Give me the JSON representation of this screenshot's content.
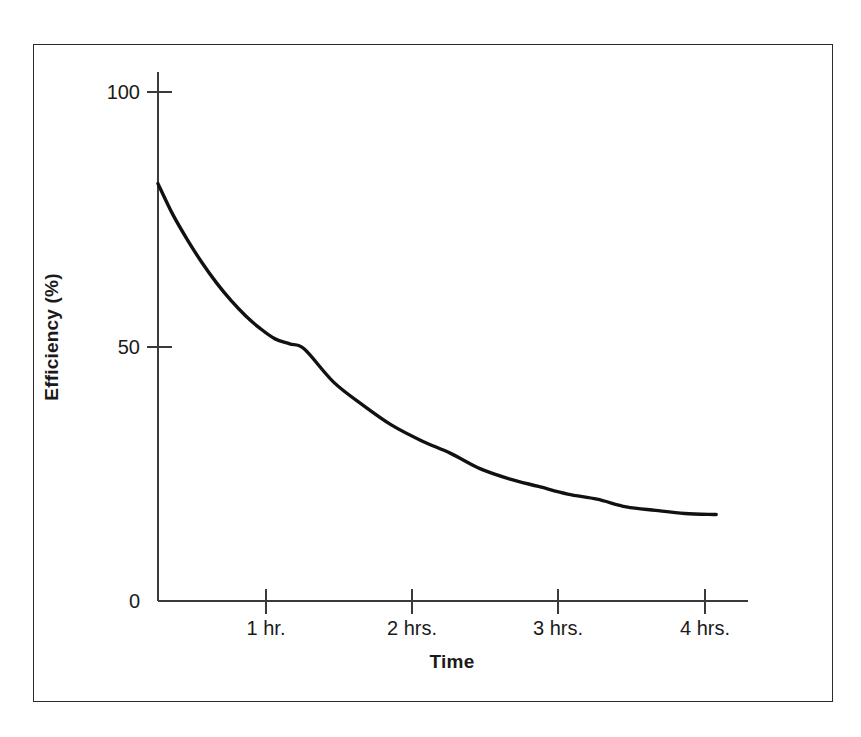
{
  "figure": {
    "frame_color": "#2b2b2b",
    "background_color": "#ffffff",
    "curve_color": "#111111",
    "axis_color": "#3a3a3a"
  },
  "axes": {
    "y_title": "Efficiency (%)",
    "x_title": "Time",
    "y_tick_labels": [
      "100",
      "50",
      "0"
    ],
    "x_tick_labels": [
      "1 hr.",
      "2 hrs.",
      "3 hrs.",
      "4 hrs."
    ]
  },
  "chart_data": {
    "type": "line",
    "title": "",
    "subtitle": "",
    "xlabel": "Time",
    "ylabel": "Efficiency (%)",
    "xlim": [
      0,
      4.05
    ],
    "ylim": [
      0,
      100
    ],
    "x_ticks": [
      1,
      2,
      3,
      4
    ],
    "x_tick_labels": [
      "1 hr.",
      "2 hrs.",
      "3 hrs.",
      "4 hrs."
    ],
    "y_ticks": [
      0,
      50,
      100
    ],
    "y_tick_labels": [
      "0",
      "50",
      "100"
    ],
    "grid": false,
    "legend": null,
    "legend_position": "none",
    "annotations": [],
    "series": [
      {
        "name": "Efficiency decay",
        "x": [
          0.0,
          0.1,
          0.2,
          0.3,
          0.4,
          0.5,
          0.6,
          0.7,
          0.8,
          0.9,
          1.0,
          1.2,
          1.4,
          1.6,
          1.8,
          2.0,
          2.2,
          2.4,
          2.6,
          2.8,
          3.0,
          3.2,
          3.4,
          3.6,
          3.8,
          3.8
        ],
        "y": [
          82.0,
          76.0,
          71.0,
          66.5,
          62.5,
          59.0,
          56.0,
          53.5,
          51.5,
          50.5,
          49.5,
          43.0,
          38.5,
          34.5,
          31.5,
          29.0,
          26.0,
          24.0,
          22.5,
          21.0,
          20.0,
          18.5,
          17.8,
          17.2,
          17.0,
          17.0
        ]
      }
    ]
  }
}
